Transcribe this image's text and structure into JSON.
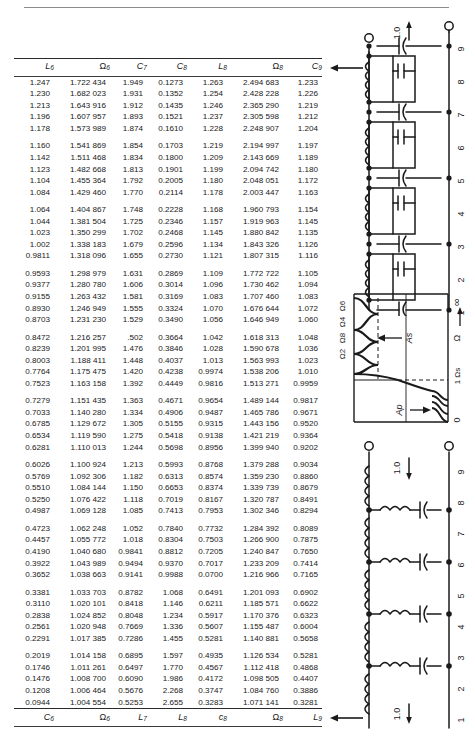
{
  "page": {
    "kind": "filter-design-table-page",
    "ink_color": "#1a1a1a",
    "rule_color": "#2a2a2a"
  },
  "table": {
    "header_top": [
      {
        "base": "L",
        "sub": "6",
        "italic": true
      },
      {
        "base": "Ω",
        "sub": "6",
        "italic": false
      },
      {
        "base": "C",
        "sub": "7",
        "italic": true
      },
      {
        "base": "C",
        "sub": "8",
        "italic": true
      },
      {
        "base": "L",
        "sub": "8",
        "italic": true
      },
      {
        "base": "Ω",
        "sub": "8",
        "italic": false
      },
      {
        "base": "C",
        "sub": "9",
        "italic": true
      }
    ],
    "header_bottom": [
      {
        "base": "C",
        "sub": "6",
        "italic": true
      },
      {
        "base": "Ω",
        "sub": "6",
        "italic": false
      },
      {
        "base": "L",
        "sub": "7",
        "italic": true
      },
      {
        "base": "L",
        "sub": "8",
        "italic": true
      },
      {
        "base": "c",
        "sub": "8",
        "italic": true
      },
      {
        "base": "Ω",
        "sub": "8",
        "italic": false
      },
      {
        "base": "L",
        "sub": "9",
        "italic": true
      }
    ],
    "groups": [
      {
        "rows": [
          [
            "1.247",
            "1.722 434",
            "1.949",
            "0.1273",
            "1.263",
            "2.494 683",
            "1.233"
          ],
          [
            "1.230",
            "1.682 023",
            "1.931",
            "0.1352",
            "1.254",
            "2.428 228",
            "1.226"
          ],
          [
            "1.213",
            "1.643 916",
            "1.912",
            "0.1435",
            "1.246",
            "2.365 290",
            "1.219"
          ],
          [
            "1.196",
            "1.607 957",
            "1.893",
            "0.1521",
            "1.237",
            "2.305 598",
            "1.212"
          ],
          [
            "1.178",
            "1.573 989",
            "1.874",
            "0.1610",
            "1.228",
            "2.248 907",
            "1.204"
          ]
        ]
      },
      {
        "rows": [
          [
            "1.160",
            "1.541 869",
            "1.854",
            "0.1703",
            "1.219",
            "2.194 997",
            "1.197"
          ],
          [
            "1.142",
            "1.511 468",
            "1.834",
            "0.1800",
            "1.209",
            "2.143 669",
            "1.189"
          ],
          [
            "1.123",
            "1.482 668",
            "1.813",
            "0.1901",
            "1.199",
            "2.094 742",
            "1.180"
          ],
          [
            "1.104",
            "1.455 364",
            "1.792",
            "0.2005",
            "1.180",
            "2.048 051",
            "1.172"
          ],
          [
            "1.084",
            "1.429 460",
            "1.770",
            "0.2114",
            "1.178",
            "2.003 447",
            "1.163"
          ]
        ]
      },
      {
        "rows": [
          [
            "1.064",
            "1.404 867",
            "1.748",
            "0.2228",
            "1.168",
            "1.960 793",
            "1.154"
          ],
          [
            "1.044",
            "1.381 504",
            "1.725",
            "0.2346",
            "1.157",
            "1.919 963",
            "1.145"
          ],
          [
            "1.023",
            "1.350 299",
            "1.702",
            "0.2468",
            "1.145",
            "1.880 842",
            "1.135"
          ],
          [
            "1.002",
            "1.338 183",
            "1.679",
            "0.2596",
            "1.134",
            "1.843 326",
            "1.126"
          ],
          [
            "0.9811",
            "1.318 096",
            "1.655",
            "0.2730",
            "1.121",
            "1.807 315",
            "1.116"
          ]
        ]
      },
      {
        "rows": [
          [
            "0.9593",
            "1.298 979",
            "1.631",
            "0.2869",
            "1.109",
            "1.772 722",
            "1.105"
          ],
          [
            "0.9377",
            "1.280 780",
            "1.606",
            "0.3014",
            "1.096",
            "1.730 462",
            "1.094"
          ],
          [
            "0.9155",
            "1.263 432",
            "1.581",
            "0.3169",
            "1.083",
            "1.707 460",
            "1.083"
          ],
          [
            "0.8930",
            "1.246 949",
            "1.555",
            "0.3324",
            "1.070",
            "1.676 644",
            "1.072"
          ],
          [
            "0.8703",
            "1.231 230",
            "1.529",
            "0.3490",
            "1.056",
            "1.646 949",
            "1.060"
          ]
        ]
      },
      {
        "rows": [
          [
            "0.8472",
            "1.216 257",
            ".502",
            "0.3664",
            "1.042",
            "1.618 313",
            "1.048"
          ],
          [
            "0.8239",
            "1.201 995",
            "1.476",
            "0.3846",
            "1.028",
            "1.590 678",
            "1.036"
          ],
          [
            "0.8003",
            "1.188 411",
            "1.448",
            "0.4037",
            "1.013",
            "1.563 993",
            "1.023"
          ],
          [
            "0.7764",
            "1.175 475",
            "1.420",
            "0.4238",
            "0.9974",
            "1.538 206",
            "1.010"
          ],
          [
            "0.7523",
            "1.163 158",
            "1.392",
            "0.4449",
            "0.9816",
            "1.513 271",
            "0.9959"
          ]
        ]
      },
      {
        "rows": [
          [
            "0.7279",
            "1.151 435",
            "1.363",
            "0.4671",
            "0.9654",
            "1.489 144",
            "0.9817"
          ],
          [
            "0.7033",
            "1.140 280",
            "1.334",
            "0.4906",
            "0.9487",
            "1.465 786",
            "0.9671"
          ],
          [
            "0.6785",
            "1.129 672",
            "1.305",
            "0.5155",
            "0.9315",
            "1.443 156",
            "0.9520"
          ],
          [
            "0.6534",
            "1.119 590",
            "1.275",
            "0.5418",
            "0.9138",
            "1.421 219",
            "0.9364"
          ],
          [
            "0.6281",
            "1.110 013",
            "1.244",
            "0.5698",
            "0.8956",
            "1.399 940",
            "0.9202"
          ]
        ]
      },
      {
        "rows": [
          [
            "0.6026",
            "1.100 924",
            "1.213",
            "0.5993",
            "0.8768",
            "1.379 288",
            "0.9034"
          ],
          [
            "0.5769",
            "1.092 306",
            "1.182",
            "0.6313",
            "0.8574",
            "1.359 230",
            "0.8860"
          ],
          [
            "0.5510",
            "1.084 144",
            "1.150",
            "0.6653",
            "0.8374",
            "1.339 739",
            "0.8679"
          ],
          [
            "0.5250",
            "1.076 422",
            "1.118",
            "0.7019",
            "0.8167",
            "1.320 787",
            "0.8491"
          ],
          [
            "0.4987",
            "1.069 128",
            "1.085",
            "0.7413",
            "0.7953",
            "1.302 346",
            "0.8294"
          ]
        ]
      },
      {
        "rows": [
          [
            "0.4723",
            "1.062 248",
            "1.052",
            "0.7840",
            "0.7732",
            "1.284 392",
            "0.8089"
          ],
          [
            "0.4457",
            "1.055 772",
            "1.018",
            "0.8304",
            "0.7503",
            "1.266 900",
            "0.7875"
          ],
          [
            "0.4190",
            "1.040 680",
            "0.9841",
            "0.8812",
            "0.7205",
            "1.240 847",
            "0.7650"
          ],
          [
            "0.3922",
            "1.043 989",
            "0.9494",
            "0.9370",
            "0.7017",
            "1.233 209",
            "0.7414"
          ],
          [
            "0.3652",
            "1.038 663",
            "0.9141",
            "0.9988",
            "0.0700",
            "1.216 966",
            "0.7165"
          ]
        ]
      },
      {
        "rows": [
          [
            "0.3381",
            "1.033 703",
            "0.8782",
            "1.068",
            "0.6491",
            "1.201 093",
            "0.6902"
          ],
          [
            "0.3110",
            "1.020 101",
            "0.8418",
            "1.146",
            "0.6211",
            "1.185 571",
            "0.6622"
          ],
          [
            "0.2838",
            "1.024 852",
            "0.8048",
            "1.234",
            "0.5917",
            "1.170 376",
            "0.6323"
          ],
          [
            "0.2561",
            "1.020 948",
            "0.7669",
            "1.336",
            "0.5607",
            "1.155 487",
            "0.6004"
          ],
          [
            "0.2291",
            "1.017 385",
            "0.7286",
            "1.455",
            "0.5281",
            "1.140 881",
            "0.5658"
          ]
        ]
      },
      {
        "rows": [
          [
            "0.2019",
            "1.014 158",
            "0.6895",
            "1.597",
            "0.4935",
            "1.126 534",
            "0.5281"
          ],
          [
            "0.1746",
            "1.011 261",
            "0.6497",
            "1.770",
            "0.4567",
            "1.112 418",
            "0.4868"
          ],
          [
            "0.1476",
            "1.008 700",
            "0.6090",
            "1.986",
            "0.4172",
            "1.098 505",
            "0.4407"
          ],
          [
            "0.1208",
            "1.006 464",
            "0.5676",
            "2.268",
            "0.3747",
            "1.084 760",
            "0.3886"
          ],
          [
            "0.0944",
            "1.004 554",
            "0.5253",
            "2.655",
            "0.3283",
            "1.071 141",
            "0.3281"
          ]
        ]
      }
    ]
  },
  "figures": {
    "top_circuit": {
      "name": "parallel-tank-ladder-network",
      "source_label": "1.0",
      "node_numbers": [
        "9",
        "8",
        "7",
        "6",
        "5",
        "4",
        "3",
        "2",
        "1"
      ]
    },
    "response_plot": {
      "name": "attenuation-vs-frequency-plot",
      "pole_labels": [
        "Ω6",
        "Ω4",
        "Ω8",
        "Ω2"
      ],
      "stopband_attenuation_label": "As",
      "passband_ripple_label": "Ap",
      "axis_symbol": "Ω",
      "axis_infinity": "∞",
      "band_edge_label": "1 Ωs",
      "origin_label": "0"
    },
    "bottom_circuit": {
      "name": "series-inductor-ladder-network",
      "source_label": "1.0",
      "node_numbers": [
        "9",
        "8",
        "7",
        "6",
        "5",
        "4",
        "3",
        "2",
        "1"
      ]
    }
  }
}
